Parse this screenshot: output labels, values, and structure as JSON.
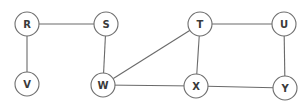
{
  "diagram": {
    "type": "undirected-graph",
    "node_radius": 12,
    "nodes": [
      {
        "id": "R",
        "label": "R",
        "x": 27,
        "y": 24
      },
      {
        "id": "S",
        "label": "S",
        "x": 106,
        "y": 24
      },
      {
        "id": "T",
        "label": "T",
        "x": 200,
        "y": 24
      },
      {
        "id": "U",
        "label": "U",
        "x": 284,
        "y": 24
      },
      {
        "id": "V",
        "label": "V",
        "x": 27,
        "y": 84
      },
      {
        "id": "W",
        "label": "W",
        "x": 103,
        "y": 85
      },
      {
        "id": "X",
        "label": "X",
        "x": 196,
        "y": 86
      },
      {
        "id": "Y",
        "label": "Y",
        "x": 285,
        "y": 88
      }
    ],
    "edges": [
      {
        "from": "R",
        "to": "S"
      },
      {
        "from": "R",
        "to": "V"
      },
      {
        "from": "S",
        "to": "W"
      },
      {
        "from": "W",
        "to": "T"
      },
      {
        "from": "W",
        "to": "X"
      },
      {
        "from": "T",
        "to": "U"
      },
      {
        "from": "T",
        "to": "X"
      },
      {
        "from": "U",
        "to": "Y"
      },
      {
        "from": "X",
        "to": "Y"
      }
    ]
  }
}
